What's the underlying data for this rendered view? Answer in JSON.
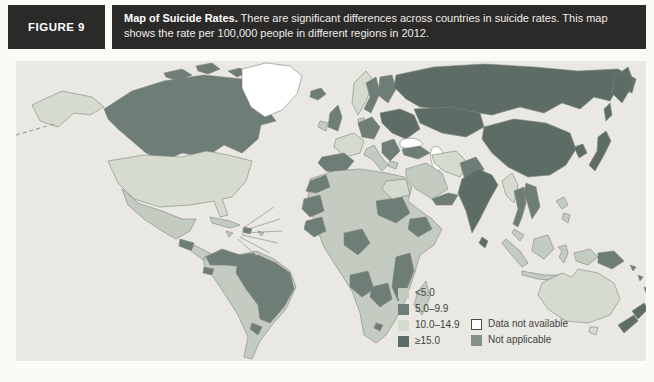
{
  "figure": {
    "label": "FIGURE 9",
    "caption_title": "Map of Suicide Rates.",
    "caption_text": " There are significant differences across countries in suicide rates. This map shows the rate per 100,000 people in different regions in 2012."
  },
  "map": {
    "type": "choropleth-world-map",
    "colors": {
      "ocean": "#e9e8e3",
      "rate_lt5": "#c4ccc2",
      "rate_5_9": "#6f7d77",
      "rate_10_14": "#d5dbce",
      "rate_ge15": "#5e6c66",
      "no_data": "#ffffff",
      "not_applicable": "#848f89"
    }
  },
  "legend": {
    "column1": [
      {
        "label": "<5.0",
        "color_key": "rate_lt5"
      },
      {
        "label": "5.0–9.9",
        "color_key": "rate_5_9"
      },
      {
        "label": "10.0–14.9",
        "color_key": "rate_10_14"
      },
      {
        "label": "≥15.0",
        "color_key": "rate_ge15"
      }
    ],
    "column2": [
      {
        "label": "Data not available",
        "color_key": "no_data",
        "outlined": true
      },
      {
        "label": "Not applicable",
        "color_key": "not_applicable"
      }
    ]
  }
}
